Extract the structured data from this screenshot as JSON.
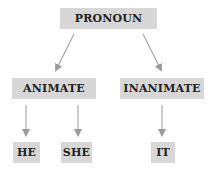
{
  "diagram": {
    "type": "tree",
    "root": {
      "label": "PRONOUN"
    },
    "level1": [
      {
        "label": "ANIMATE"
      },
      {
        "label": "INANIMATE"
      }
    ],
    "level2": [
      {
        "label": "HE",
        "parent": "ANIMATE"
      },
      {
        "label": "SHE",
        "parent": "ANIMATE"
      },
      {
        "label": "IT",
        "parent": "INANIMATE"
      }
    ],
    "colors": {
      "box_fill": "#d7d7d7",
      "arrow": "#999999",
      "text": "#222222"
    }
  }
}
